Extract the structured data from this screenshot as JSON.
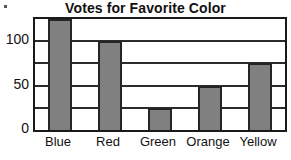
{
  "chart_data": {
    "type": "bar",
    "title": "Votes for Favorite Color",
    "xlabel": "",
    "ylabel": "",
    "categories": [
      "Blue",
      "Red",
      "Green",
      "Orange",
      "Yellow"
    ],
    "values": [
      125,
      100,
      25,
      50,
      75
    ],
    "ylim": [
      0,
      125
    ],
    "y_tick_labels": [
      "0",
      "50",
      "100"
    ],
    "y_tick_values": [
      0,
      50,
      100
    ],
    "gridline_values": [
      25,
      50,
      75,
      100
    ],
    "grid": true,
    "legend": "none",
    "bar_fill_color": "#808080",
    "bar_edge_color": "#242424",
    "frame_color": "#1a1a1a",
    "background_color": "#ffffff",
    "text_color": "#111111"
  },
  "artifacts": {
    "scan_dot": "·"
  }
}
